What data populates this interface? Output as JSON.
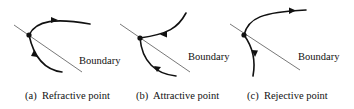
{
  "figure": {
    "colors": {
      "ink": "#111111",
      "boundary": "#555555",
      "background": "#ffffff"
    },
    "panels": [
      {
        "id": "a",
        "boundary_label": "Boundary",
        "caption": "(a)  Refractive point",
        "point_type": "refractive"
      },
      {
        "id": "b",
        "boundary_label": "Boundary",
        "caption": "(b)  Attractive point",
        "point_type": "attractive"
      },
      {
        "id": "c",
        "boundary_label": "Boundary",
        "caption": "(c)  Rejective point",
        "point_type": "rejective"
      }
    ]
  }
}
